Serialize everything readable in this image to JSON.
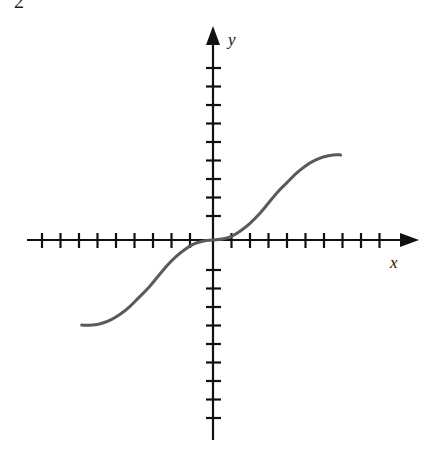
{
  "figure": {
    "corner_mark": "2",
    "background_color": "#ffffff",
    "axis_color": "#111111",
    "curve_color": "#5a5a5a",
    "x_axis_label": "x",
    "y_axis_label": "y",
    "x_axis_arrow": "arrow-right",
    "y_axis_arrow": "arrow-up"
  },
  "chart_data": {
    "type": "line",
    "title": "",
    "subtitle": "",
    "xlabel": "x",
    "ylabel": "y",
    "grid": false,
    "legend": null,
    "annotations": [],
    "axis": {
      "origin_px": [
        213,
        240
      ],
      "tick_spacing_px": 18.5,
      "x_ticks_left_count": 10,
      "x_ticks_right_count": 9,
      "y_ticks_up_count": 10,
      "y_ticks_down_count": 9,
      "tick_labels": [],
      "xlim": [
        -10,
        9.5
      ],
      "ylim": [
        -9.5,
        10
      ]
    },
    "x": [
      -7.1,
      -6.5,
      -6.0,
      -5.5,
      -5.0,
      -4.5,
      -4.0,
      -3.5,
      -3.0,
      -2.5,
      -2.0,
      -1.5,
      -1.0,
      -0.5,
      0.0,
      0.5,
      1.0,
      1.5,
      2.0,
      2.5,
      3.0,
      3.5,
      4.0,
      4.5,
      5.0,
      5.5,
      6.0,
      6.5,
      6.9
    ],
    "y": [
      -4.6,
      -4.6,
      -4.5,
      -4.3,
      -4.0,
      -3.6,
      -3.1,
      -2.6,
      -2.0,
      -1.4,
      -0.9,
      -0.5,
      -0.2,
      -0.05,
      0.0,
      0.05,
      0.2,
      0.5,
      0.9,
      1.4,
      2.0,
      2.6,
      3.1,
      3.6,
      4.0,
      4.3,
      4.5,
      4.6,
      4.6
    ],
    "series": [
      {
        "name": "curve",
        "color": "#5a5a5a",
        "stroke_width": 3,
        "left_endpoint_px": [
          82,
          355
        ],
        "right_endpoint_px": [
          340,
          126
        ]
      }
    ]
  }
}
